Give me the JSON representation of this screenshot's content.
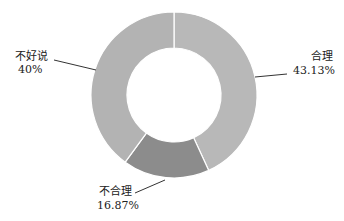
{
  "chart_data": {
    "type": "pie",
    "subtype": "donut",
    "title": "",
    "slices": [
      {
        "label": "合理",
        "value": 43.13,
        "display": "43.13%",
        "color": "#b8b8b8"
      },
      {
        "label": "不合理",
        "value": 16.87,
        "display": "16.87%",
        "color": "#8c8c8c"
      },
      {
        "label": "不好说",
        "value": 40,
        "display": "40%",
        "color": "#b3b3b3"
      }
    ],
    "start_angle": "12 o'clock, clockwise",
    "legend": "none"
  },
  "labels": {
    "heli_name": "合理",
    "heli_pct": "43.13%",
    "buheli_name": "不合理",
    "buheli_pct": "16.87%",
    "buhaoshuo_name": "不好说",
    "buhaoshuo_pct": "40%"
  }
}
